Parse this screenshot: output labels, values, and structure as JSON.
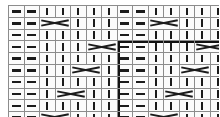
{
  "chart_data": {
    "type": "table",
    "title": "",
    "xlabel": "",
    "ylabel": "",
    "columns": 14,
    "rows": 10,
    "grid": true,
    "legend": [],
    "symbols": {
      "purl": "-",
      "knit": "|",
      "cross": "X",
      "cross_span": 2
    },
    "symbol_names": {
      "purl": "purl-dash-icon",
      "knit": "knit-bar-icon",
      "cross": "cable-cross-icon"
    },
    "colors": {
      "symbol": "#1b1b1b",
      "cell_border": "#8c8c8c",
      "outer_border": "#3a3a3a",
      "repeat_border": "#111111",
      "cell_fill": "#fbfbfb",
      "background": "#ffffff"
    },
    "repeat_box": {
      "row_start": 4,
      "row_end": 10,
      "col_start": 8,
      "col_end": 14
    },
    "categories": [
      "c1",
      "c2",
      "c3",
      "c4",
      "c5",
      "c6",
      "c7",
      "c8",
      "c9",
      "c10",
      "c11",
      "c12",
      "c13",
      "c14"
    ],
    "row_labels": [
      "r1",
      "r2",
      "r3",
      "r4",
      "r5",
      "r6",
      "r7",
      "r8",
      "r9",
      "r10"
    ],
    "cells": [
      [
        "purl",
        "purl",
        "knit",
        "knit",
        "knit",
        "knit",
        "knit",
        "purl",
        "purl",
        "knit",
        "knit",
        "knit",
        "knit",
        "knit"
      ],
      [
        "purl",
        "purl",
        "cross",
        "cross",
        "knit",
        "knit",
        "knit",
        "purl",
        "purl",
        "cross",
        "cross",
        "knit",
        "knit",
        "knit"
      ],
      [
        "purl",
        "purl",
        "knit",
        "knit",
        "knit",
        "knit",
        "knit",
        "purl",
        "purl",
        "knit",
        "knit",
        "knit",
        "knit",
        "knit"
      ],
      [
        "purl",
        "purl",
        "knit",
        "knit",
        "knit",
        "cross",
        "cross",
        "purl",
        "purl",
        "knit",
        "knit",
        "knit",
        "cross",
        "cross"
      ],
      [
        "purl",
        "purl",
        "knit",
        "knit",
        "knit",
        "knit",
        "knit",
        "purl",
        "purl",
        "knit",
        "knit",
        "knit",
        "knit",
        "knit"
      ],
      [
        "purl",
        "purl",
        "knit",
        "knit",
        "cross",
        "cross",
        "knit",
        "purl",
        "purl",
        "knit",
        "knit",
        "cross",
        "cross",
        "knit"
      ],
      [
        "purl",
        "purl",
        "knit",
        "knit",
        "knit",
        "knit",
        "knit",
        "purl",
        "purl",
        "knit",
        "knit",
        "knit",
        "knit",
        "knit"
      ],
      [
        "purl",
        "purl",
        "knit",
        "cross",
        "cross",
        "knit",
        "knit",
        "purl",
        "purl",
        "knit",
        "cross",
        "cross",
        "knit",
        "knit"
      ],
      [
        "purl",
        "purl",
        "knit",
        "knit",
        "knit",
        "knit",
        "knit",
        "purl",
        "purl",
        "knit",
        "knit",
        "knit",
        "knit",
        "knit"
      ],
      [
        "purl",
        "purl",
        "cross",
        "cross",
        "knit",
        "knit",
        "knit",
        "purl",
        "purl",
        "cross",
        "cross",
        "knit",
        "knit",
        "knit"
      ]
    ]
  }
}
